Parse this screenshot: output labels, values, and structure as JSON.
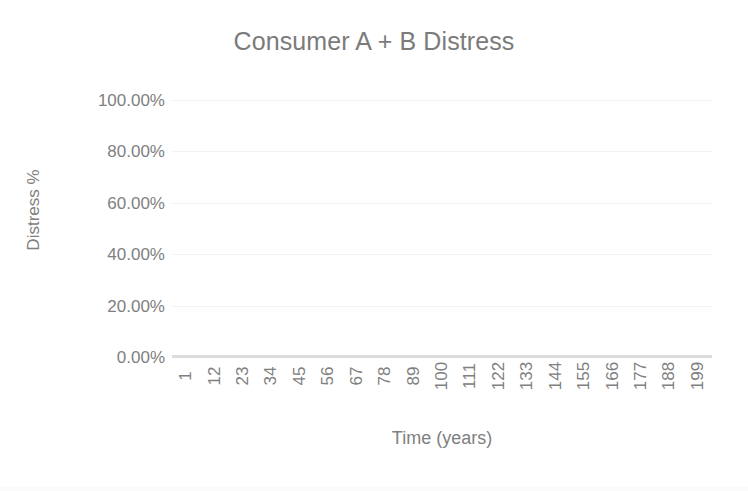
{
  "chart_data": {
    "type": "line",
    "title": "Consumer A + B Distress",
    "xlabel": "Time (years)",
    "ylabel": "Distress %",
    "ylim": [
      0,
      1
    ],
    "ytick_labels": [
      "100.00%",
      "80.00%",
      "60.00%",
      "40.00%",
      "20.00%",
      "0.00%"
    ],
    "ytick_values": [
      1.0,
      0.8,
      0.6,
      0.4,
      0.2,
      0.0
    ],
    "xtick_labels": [
      "1",
      "12",
      "23",
      "34",
      "45",
      "56",
      "67",
      "78",
      "89",
      "100",
      "111",
      "122",
      "133",
      "144",
      "155",
      "166",
      "177",
      "188",
      "199"
    ],
    "xtick_values": [
      1,
      12,
      23,
      34,
      45,
      56,
      67,
      78,
      89,
      100,
      111,
      122,
      133,
      144,
      155,
      166,
      177,
      188,
      199
    ],
    "xlim": [
      1,
      199
    ],
    "grid": true,
    "grid_axis": "y",
    "legend": false,
    "series": [
      {
        "name": "Consumer A + B Distress",
        "color": "#d6d6d6",
        "x": [
          1,
          12,
          23,
          34,
          45,
          56,
          67,
          78,
          89,
          100,
          111,
          122,
          133,
          144,
          155,
          166,
          177,
          188,
          199
        ],
        "values": [
          0.0,
          0.0,
          0.0,
          0.0,
          0.0,
          0.0,
          0.0,
          0.0,
          0.0,
          0.0,
          0.0,
          0.0,
          0.0,
          0.0,
          0.0,
          0.0,
          0.0,
          0.0,
          0.0
        ]
      }
    ],
    "annotations": []
  }
}
